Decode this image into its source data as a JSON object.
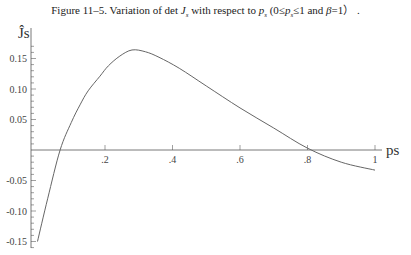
{
  "caption": {
    "prefix": "Figure 11–5. Variation of det ",
    "J": "J",
    "J_sub": "s",
    "mid": " with respect to ",
    "p": "p",
    "p_sub": "s",
    "range_open": " (0≤",
    "range_p": "p",
    "range_p_sub": "s",
    "range_close": "≤1 and ",
    "beta": "β",
    "beta_val": "=1） ."
  },
  "chart_data": {
    "type": "line",
    "xlabel": "ps",
    "ylabel": "Ĵs",
    "xlim": [
      -0.02,
      1.0
    ],
    "ylim": [
      -0.16,
      0.17
    ],
    "xticks": [
      0.2,
      0.4,
      0.6,
      0.8,
      1.0
    ],
    "xtick_labels": [
      ".2",
      ".4",
      ".6",
      ".8",
      "1"
    ],
    "yticks": [
      -0.15,
      -0.1,
      -0.05,
      0.05,
      0.1,
      0.15
    ],
    "ytick_labels": [
      "-0.15",
      "-0.10",
      "-0.05",
      "0.05",
      "0.10",
      "0.15"
    ],
    "grid": false,
    "series": [
      {
        "name": "det Js",
        "x": [
          0.0,
          0.03,
          0.067,
          0.1,
          0.126,
          0.15,
          0.185,
          0.21,
          0.244,
          0.28,
          0.32,
          0.36,
          0.42,
          0.5,
          0.6,
          0.7,
          0.8,
          0.9,
          1.0
        ],
        "y": [
          -0.15,
          -0.08,
          0.0,
          0.045,
          0.074,
          0.097,
          0.121,
          0.138,
          0.154,
          0.164,
          0.161,
          0.152,
          0.134,
          0.105,
          0.069,
          0.036,
          0.003,
          -0.02,
          -0.033
        ]
      }
    ]
  }
}
